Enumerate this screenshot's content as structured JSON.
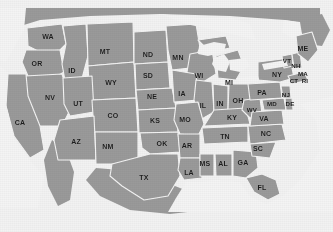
{
  "map": {
    "title": "United States state outline map",
    "colors": {
      "land": "#9a9a9a",
      "border": "#f4f4f4",
      "water": "#f4f4f4",
      "background": "#f2f2f2",
      "label_text": "#1c1c1c"
    },
    "states": [
      {
        "code": "WA",
        "x": 48,
        "y": 36,
        "size": "normal"
      },
      {
        "code": "OR",
        "x": 37,
        "y": 63,
        "size": "normal"
      },
      {
        "code": "ID",
        "x": 72,
        "y": 70,
        "size": "normal"
      },
      {
        "code": "MT",
        "x": 105,
        "y": 51,
        "size": "normal"
      },
      {
        "code": "ND",
        "x": 148,
        "y": 54,
        "size": "normal"
      },
      {
        "code": "MN",
        "x": 178,
        "y": 57,
        "size": "normal"
      },
      {
        "code": "WY",
        "x": 111,
        "y": 82,
        "size": "normal"
      },
      {
        "code": "SD",
        "x": 148,
        "y": 75,
        "size": "normal"
      },
      {
        "code": "WI",
        "x": 199,
        "y": 75,
        "size": "normal"
      },
      {
        "code": "MI",
        "x": 229,
        "y": 82,
        "size": "normal"
      },
      {
        "code": "NV",
        "x": 50,
        "y": 97,
        "size": "normal"
      },
      {
        "code": "UT",
        "x": 78,
        "y": 103,
        "size": "normal"
      },
      {
        "code": "NE",
        "x": 152,
        "y": 96,
        "size": "normal"
      },
      {
        "code": "IA",
        "x": 182,
        "y": 93,
        "size": "normal"
      },
      {
        "code": "IL",
        "x": 203,
        "y": 105,
        "size": "normal"
      },
      {
        "code": "IN",
        "x": 220,
        "y": 103,
        "size": "normal"
      },
      {
        "code": "OH",
        "x": 238,
        "y": 100,
        "size": "normal"
      },
      {
        "code": "NY",
        "x": 277,
        "y": 74,
        "size": "normal"
      },
      {
        "code": "ME",
        "x": 303,
        "y": 48,
        "size": "normal"
      },
      {
        "code": "VT",
        "x": 287,
        "y": 61,
        "size": "sm"
      },
      {
        "code": "NH",
        "x": 296,
        "y": 66,
        "size": "sm"
      },
      {
        "code": "MA",
        "x": 303,
        "y": 74,
        "size": "sm"
      },
      {
        "code": "CT",
        "x": 294,
        "y": 81,
        "size": "sm"
      },
      {
        "code": "RI",
        "x": 305,
        "y": 81,
        "size": "sm"
      },
      {
        "code": "PA",
        "x": 262,
        "y": 92,
        "size": "normal"
      },
      {
        "code": "NJ",
        "x": 286,
        "y": 95,
        "size": "sm"
      },
      {
        "code": "MD",
        "x": 272,
        "y": 104,
        "size": "sm"
      },
      {
        "code": "DE",
        "x": 290,
        "y": 104,
        "size": "sm"
      },
      {
        "code": "CA",
        "x": 20,
        "y": 122,
        "size": "normal"
      },
      {
        "code": "CO",
        "x": 113,
        "y": 115,
        "size": "normal"
      },
      {
        "code": "KS",
        "x": 155,
        "y": 120,
        "size": "normal"
      },
      {
        "code": "MO",
        "x": 185,
        "y": 119,
        "size": "normal"
      },
      {
        "code": "KY",
        "x": 232,
        "y": 117,
        "size": "normal"
      },
      {
        "code": "WV",
        "x": 252,
        "y": 110,
        "size": "sm"
      },
      {
        "code": "VA",
        "x": 264,
        "y": 118,
        "size": "normal"
      },
      {
        "code": "AZ",
        "x": 76,
        "y": 141,
        "size": "normal"
      },
      {
        "code": "NM",
        "x": 108,
        "y": 146,
        "size": "normal"
      },
      {
        "code": "OK",
        "x": 162,
        "y": 143,
        "size": "normal"
      },
      {
        "code": "AR",
        "x": 187,
        "y": 145,
        "size": "normal"
      },
      {
        "code": "TN",
        "x": 225,
        "y": 136,
        "size": "normal"
      },
      {
        "code": "NC",
        "x": 266,
        "y": 133,
        "size": "normal"
      },
      {
        "code": "SC",
        "x": 258,
        "y": 148,
        "size": "normal"
      },
      {
        "code": "MS",
        "x": 205,
        "y": 163,
        "size": "normal"
      },
      {
        "code": "AL",
        "x": 223,
        "y": 163,
        "size": "normal"
      },
      {
        "code": "GA",
        "x": 243,
        "y": 162,
        "size": "normal"
      },
      {
        "code": "LA",
        "x": 189,
        "y": 172,
        "size": "normal"
      },
      {
        "code": "TX",
        "x": 144,
        "y": 177,
        "size": "normal"
      },
      {
        "code": "FL",
        "x": 262,
        "y": 187,
        "size": "normal"
      }
    ]
  }
}
